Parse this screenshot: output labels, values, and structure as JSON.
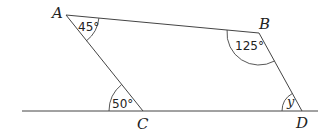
{
  "diagram": {
    "type": "geometry-quadrilateral",
    "vertices": {
      "A": {
        "label": "A",
        "angle": "45°"
      },
      "B": {
        "label": "B",
        "angle": "125°"
      },
      "C": {
        "label": "C",
        "angle": "50°"
      },
      "D": {
        "label": "D",
        "angle": "y"
      }
    },
    "colors": {
      "stroke": "#444444",
      "text": "#222222",
      "background": "#ffffff"
    }
  }
}
